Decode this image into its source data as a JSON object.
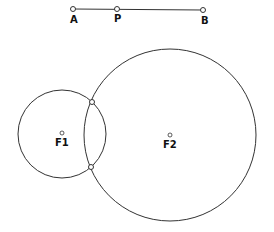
{
  "segment": {
    "points": [
      {
        "label": "A",
        "x": 73,
        "y": 9
      },
      {
        "label": "P",
        "x": 117,
        "y": 9
      },
      {
        "label": "B",
        "x": 203,
        "y": 10
      }
    ]
  },
  "circles": [
    {
      "label": "F1",
      "cx": 62,
      "cy": 134,
      "r": 44
    },
    {
      "label": "F2",
      "cx": 170,
      "cy": 135,
      "r": 86
    }
  ],
  "intersections": [
    {
      "x": 92,
      "y": 102
    },
    {
      "x": 91,
      "y": 167
    }
  ],
  "colors": {
    "stroke": "#333333",
    "label": "#111111",
    "background": "#ffffff"
  }
}
